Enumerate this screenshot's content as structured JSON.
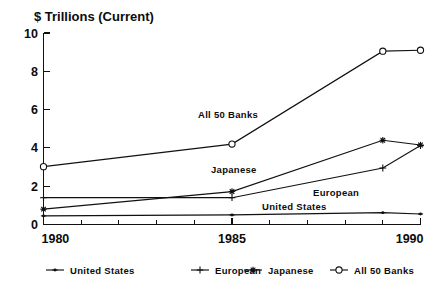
{
  "chart": {
    "title": "$ Trillions (Current)",
    "axis_x_ticks": [
      "1980",
      "1985",
      "1990"
    ],
    "axis_y_ticks": [
      "0",
      "2",
      "4",
      "6",
      "8",
      "10"
    ],
    "annotations": [
      {
        "text": "All 50 Banks"
      },
      {
        "text": "Japanese"
      },
      {
        "text": "European"
      },
      {
        "text": "United States"
      }
    ]
  },
  "legend": {
    "items": [
      {
        "label": "United States",
        "marker": "dash-dot-marker"
      },
      {
        "label": "European",
        "marker": "plus-marker"
      },
      {
        "label": "Japanese",
        "marker": "star-marker"
      },
      {
        "label": "All 50 Banks",
        "marker": "open-diamond-marker"
      }
    ]
  },
  "chart_data": {
    "type": "line",
    "title": "$ Trillions (Current)",
    "xlabel": "",
    "ylabel": "$ Trillions (Current)",
    "xlim": [
      1980,
      1990
    ],
    "ylim": [
      0,
      10
    ],
    "xticks": [
      1980,
      1985,
      1990
    ],
    "xtick_minor_step": 1,
    "yticks": [
      0,
      2,
      4,
      6,
      8,
      10
    ],
    "grid": false,
    "legend_position": "bottom",
    "x": [
      1980,
      1985,
      1989,
      1990
    ],
    "series": [
      {
        "name": "United States",
        "marker": "dash-dot-marker",
        "values": [
          0.45,
          0.5,
          0.62,
          0.55
        ]
      },
      {
        "name": "European",
        "marker": "plus-marker",
        "values": [
          1.4,
          1.4,
          2.95,
          4.12
        ]
      },
      {
        "name": "Japanese",
        "marker": "star-marker",
        "values": [
          0.8,
          1.72,
          4.4,
          4.15
        ]
      },
      {
        "name": "All 50 Banks",
        "marker": "open-diamond-marker",
        "values": [
          3.02,
          4.2,
          9.05,
          9.1
        ]
      }
    ]
  }
}
